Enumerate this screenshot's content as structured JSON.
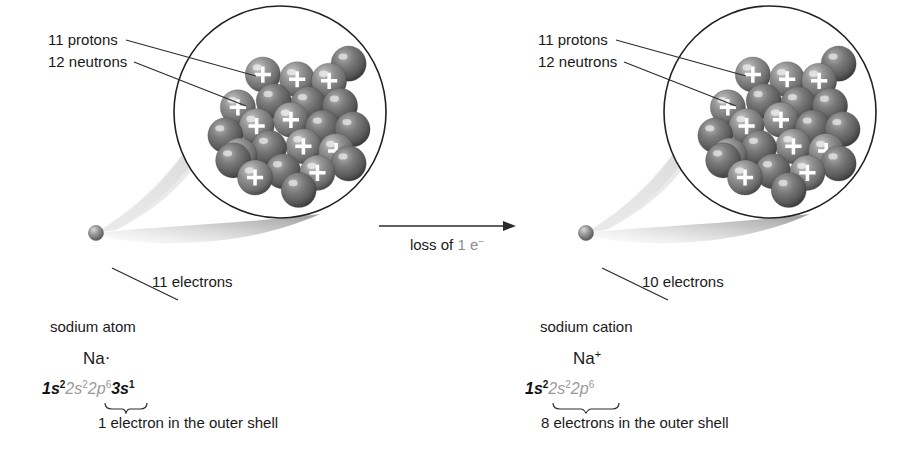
{
  "figure": {
    "background_color": "#ffffff",
    "text_color": "#1a1a1a",
    "nucleon_color": "#8a8a8a",
    "nucleon_shadow_color": "#4f4f4f",
    "proton_mark_color": "#ffffff",
    "inner_shell_text_color": "#9a9a9a",
    "cone_color": "#b8b8b8"
  },
  "arrow": {
    "label_prefix": "loss of",
    "label_value": "1 e",
    "label_superscript": "−",
    "direction": "right"
  },
  "panels": [
    {
      "id": "sodium-atom",
      "callouts": {
        "protons": "11 protons",
        "neutrons": "12 neutrons",
        "electrons": "11 electrons"
      },
      "species_name": "sodium atom",
      "symbol": "Na",
      "symbol_mark": "·",
      "symbol_mark_type": "electron-dot",
      "configuration": {
        "core": "1s",
        "core_sup": "2",
        "inner": "2s",
        "inner_sup": "2",
        "inner2": "2p",
        "inner2_sup": "6",
        "valence": "3s",
        "valence_sup": "1"
      },
      "brace_over": "3s1",
      "shell_caption": "1 electron in the outer shell",
      "counts": {
        "protons": 11,
        "neutrons": 12,
        "electrons": 11,
        "outer_shell_electrons": 1
      }
    },
    {
      "id": "sodium-cation",
      "callouts": {
        "protons": "11 protons",
        "neutrons": "12 neutrons",
        "electrons": "10 electrons"
      },
      "species_name": "sodium cation",
      "symbol": "Na",
      "symbol_mark": "+",
      "symbol_mark_type": "charge",
      "configuration": {
        "core": "1s",
        "core_sup": "2",
        "inner": "2s",
        "inner_sup": "2",
        "inner2": "2p",
        "inner2_sup": "6",
        "valence": "",
        "valence_sup": ""
      },
      "brace_over": "2s2 2p6",
      "shell_caption": "8 electrons in the outer shell",
      "counts": {
        "protons": 11,
        "neutrons": 12,
        "electrons": 10,
        "outer_shell_electrons": 8
      }
    }
  ],
  "nucleus_layout": {
    "circle_radius": 107,
    "nucleon_radius": 22,
    "nucleons": [
      {
        "x": 88,
        "y": -62,
        "type": "neutron"
      },
      {
        "x": -22,
        "y": -48,
        "type": "proton"
      },
      {
        "x": 22,
        "y": -42,
        "type": "proton"
      },
      {
        "x": 63,
        "y": -40,
        "type": "proton"
      },
      {
        "x": -8,
        "y": -14,
        "type": "neutron"
      },
      {
        "x": 36,
        "y": -10,
        "type": "neutron"
      },
      {
        "x": 77,
        "y": -8,
        "type": "neutron"
      },
      {
        "x": -54,
        "y": -6,
        "type": "proton"
      },
      {
        "x": 14,
        "y": 10,
        "type": "proton"
      },
      {
        "x": -30,
        "y": 18,
        "type": "proton"
      },
      {
        "x": 55,
        "y": 20,
        "type": "neutron"
      },
      {
        "x": 93,
        "y": 22,
        "type": "neutron"
      },
      {
        "x": -70,
        "y": 30,
        "type": "neutron"
      },
      {
        "x": -14,
        "y": 46,
        "type": "neutron"
      },
      {
        "x": 30,
        "y": 44,
        "type": "proton"
      },
      {
        "x": 72,
        "y": 50,
        "type": "proton"
      },
      {
        "x": -52,
        "y": 56,
        "type": "proton"
      },
      {
        "x": 4,
        "y": 76,
        "type": "neutron"
      },
      {
        "x": 48,
        "y": 78,
        "type": "proton"
      },
      {
        "x": -32,
        "y": 84,
        "type": "proton"
      },
      {
        "x": 88,
        "y": 66,
        "type": "neutron"
      },
      {
        "x": 24,
        "y": 100,
        "type": "neutron"
      },
      {
        "x": -60,
        "y": 62,
        "type": "neutron"
      }
    ]
  }
}
